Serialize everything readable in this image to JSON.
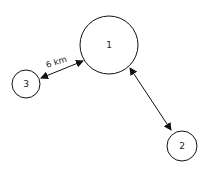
{
  "diagram": {
    "nodes": [
      {
        "id": "1",
        "label": "1",
        "cx": 109,
        "cy": 45,
        "r": 29
      },
      {
        "id": "2",
        "label": "2",
        "cx": 182,
        "cy": 146,
        "r": 15
      },
      {
        "id": "3",
        "label": "3",
        "cx": 26,
        "cy": 84,
        "r": 14
      }
    ],
    "edges": [
      {
        "from": "3",
        "to": "1",
        "label": "6 km",
        "bidirectional": true
      },
      {
        "from": "1",
        "to": "2",
        "label": "",
        "bidirectional": true
      }
    ],
    "colors": {
      "stroke": "#111111",
      "background": "#ffffff"
    }
  }
}
